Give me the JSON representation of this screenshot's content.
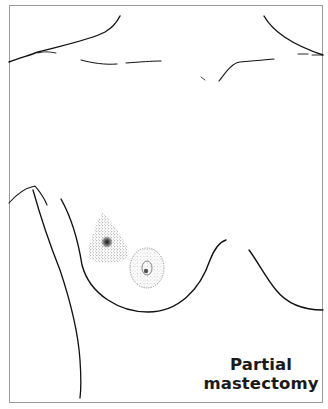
{
  "figure": {
    "caption_line1": "Partial",
    "caption_line2": "mastectomy",
    "colors": {
      "line": "#111111",
      "frame": "#9a9a9a",
      "background": "#ffffff",
      "stipple": "#333333"
    }
  }
}
